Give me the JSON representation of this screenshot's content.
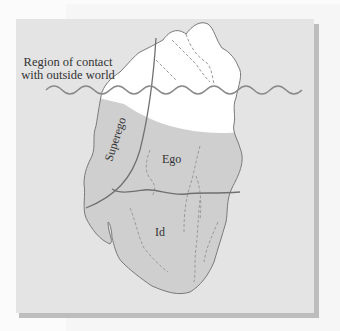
{
  "diagram": {
    "type": "iceberg-model",
    "caption": {
      "line1": "Region of contact",
      "line2": "with outside world"
    },
    "labels": {
      "superego": "Superego",
      "ego": "Ego",
      "id": "Id"
    },
    "colors": {
      "page_background": "#fbfbfb",
      "panel": "#e4e4e4",
      "panel_shadow": "#bdbdbd",
      "iceberg_above_water": "#ffffff",
      "iceberg_below_water": "#cfcfcf",
      "outline": "#7a7a7a",
      "water_line": "#8a8a8a",
      "divider_lines": "#707070",
      "dashed_cracks": "#9a9a9a"
    }
  }
}
